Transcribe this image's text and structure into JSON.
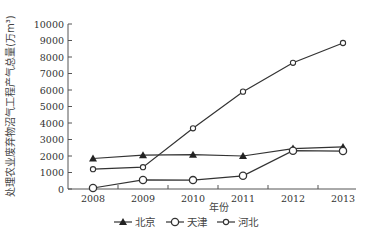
{
  "chart_data": {
    "type": "line",
    "title": "",
    "xlabel": "年份",
    "ylabel": "处理农业废弃物沼气工程产气总量(万m³)",
    "categories": [
      "2008",
      "2009",
      "2010",
      "2011",
      "2012",
      "2013"
    ],
    "ylim": [
      0,
      10000
    ],
    "yticks": [
      0,
      1000,
      2000,
      3000,
      4000,
      5000,
      6000,
      7000,
      8000,
      9000,
      10000
    ],
    "grid": false,
    "legend_position": "bottom",
    "series": [
      {
        "name": "北京",
        "marker": "filled-triangle",
        "values": [
          1850,
          2050,
          2080,
          2000,
          2450,
          2550
        ]
      },
      {
        "name": "天津",
        "marker": "open-circle-large",
        "values": [
          60,
          550,
          540,
          800,
          2320,
          2300
        ]
      },
      {
        "name": "河北",
        "marker": "open-circle-small",
        "values": [
          1200,
          1320,
          3680,
          5900,
          7650,
          8850
        ]
      }
    ]
  }
}
